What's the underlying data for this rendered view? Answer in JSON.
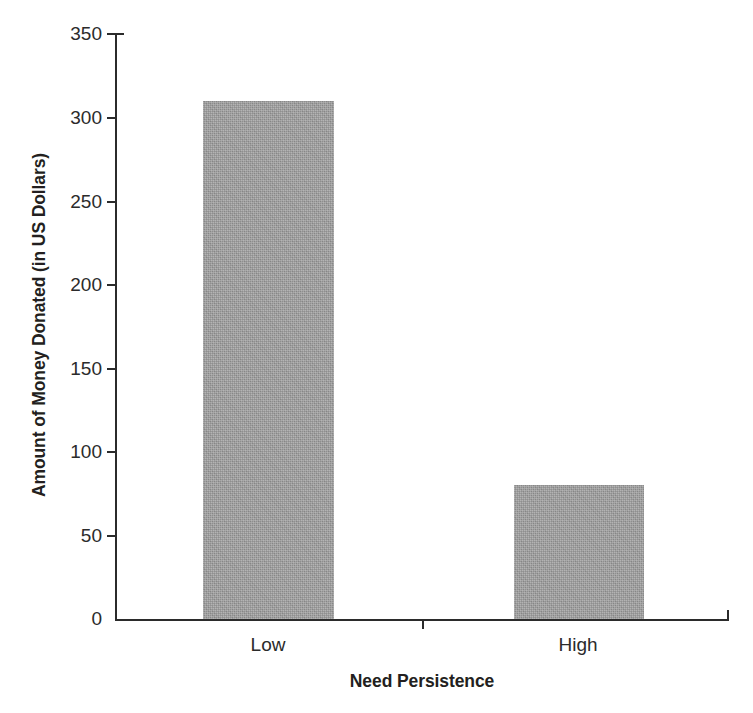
{
  "chart_data": {
    "type": "bar",
    "title": "",
    "subtitle": "",
    "categories": [
      "Low",
      "High"
    ],
    "values": [
      310,
      80
    ],
    "series": [
      {
        "name": "Amount of Money Donated (in US Dollars)",
        "values": [
          310,
          80
        ]
      }
    ],
    "xlabel": "Need Persistence",
    "ylabel": "Amount of Money Donated (in US Dollars)",
    "ylim": [
      0,
      350
    ],
    "yticks": [
      0,
      50,
      100,
      150,
      200,
      250,
      300,
      350
    ],
    "ytick_labels": [
      "0",
      "50",
      "100",
      "150",
      "200",
      "250",
      "300",
      "350"
    ],
    "xtick_labels": [
      "Low",
      "High"
    ],
    "grid": false,
    "legend": null,
    "legend_position": "none",
    "annotations": [],
    "colors": {
      "bar_fill": "#9b9b9b",
      "axis": "#2b2b2b",
      "text": "#231f20",
      "background": "#ffffff"
    }
  },
  "axes": {
    "y_title": "Amount of Money Donated (in US Dollars)",
    "x_title": "Need Persistence",
    "y_ticks": [
      {
        "label": "350",
        "value": 350
      },
      {
        "label": "300",
        "value": 300
      },
      {
        "label": "250",
        "value": 250
      },
      {
        "label": "200",
        "value": 200
      },
      {
        "label": "150",
        "value": 150
      },
      {
        "label": "100",
        "value": 100
      },
      {
        "label": "50",
        "value": 50
      },
      {
        "label": "0",
        "value": 0
      }
    ],
    "x_ticks": [
      {
        "label": "Low"
      },
      {
        "label": "High"
      }
    ]
  }
}
